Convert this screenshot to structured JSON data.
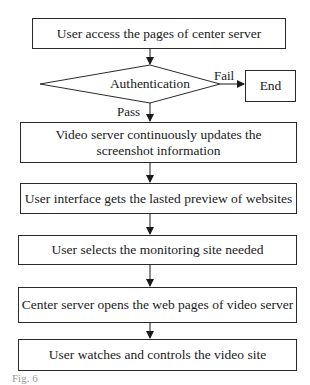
{
  "diagram": {
    "type": "flowchart",
    "nodes": [
      {
        "id": "start",
        "shape": "rect",
        "label": "User access the pages of center server"
      },
      {
        "id": "auth",
        "shape": "diamond",
        "label": "Authentication"
      },
      {
        "id": "end",
        "shape": "rect",
        "label": "End"
      },
      {
        "id": "step2",
        "shape": "rect",
        "label": "Video server continuously updates the screenshot information"
      },
      {
        "id": "step3",
        "shape": "rect",
        "label": "User interface gets the lasted preview of websites"
      },
      {
        "id": "step4",
        "shape": "rect",
        "label": "User selects the monitoring site needed"
      },
      {
        "id": "step5",
        "shape": "rect",
        "label": "Center server opens the web pages of video server"
      },
      {
        "id": "step6",
        "shape": "rect",
        "label": "User watches and controls the video site"
      }
    ],
    "edges": [
      {
        "from": "start",
        "to": "auth",
        "label": ""
      },
      {
        "from": "auth",
        "to": "end",
        "label": "Fail"
      },
      {
        "from": "auth",
        "to": "step2",
        "label": "Pass"
      },
      {
        "from": "step2",
        "to": "step3",
        "label": ""
      },
      {
        "from": "step3",
        "to": "step4",
        "label": ""
      },
      {
        "from": "step4",
        "to": "step5",
        "label": ""
      },
      {
        "from": "step5",
        "to": "step6",
        "label": ""
      }
    ],
    "caption": "Fig. 6"
  }
}
